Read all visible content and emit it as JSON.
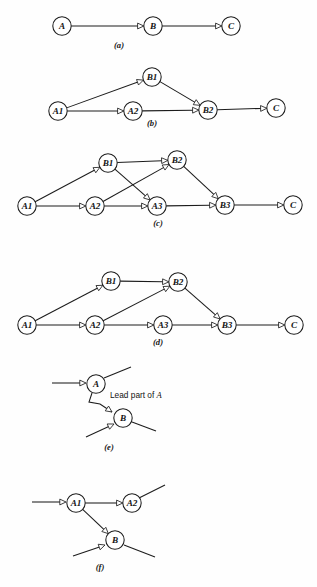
{
  "figure": {
    "width": 317,
    "height": 587,
    "background_color": "#fefefe",
    "ink_color": "#1c1c1c",
    "node_radius": 9.2,
    "arrow_style": "open-triangle-hollow"
  },
  "panels": [
    {
      "id": "a",
      "caption": "(a)",
      "caption_x": 119,
      "caption_y": 48,
      "nodes": [
        {
          "id": "A",
          "label": "A",
          "x": 62,
          "y": 26
        },
        {
          "id": "B",
          "label": "B",
          "x": 153,
          "y": 26
        },
        {
          "id": "C",
          "label": "C",
          "x": 231,
          "y": 26
        }
      ],
      "edges": [
        {
          "from": "A",
          "to": "B",
          "arrow": true
        },
        {
          "from": "B",
          "to": "C",
          "arrow": true
        }
      ],
      "stubs": []
    },
    {
      "id": "b",
      "caption": "(b)",
      "caption_x": 152,
      "caption_y": 126,
      "nodes": [
        {
          "id": "A1",
          "label": "A1",
          "x": 58,
          "y": 111
        },
        {
          "id": "A2",
          "label": "A2",
          "x": 133,
          "y": 111
        },
        {
          "id": "B1",
          "label": "B1",
          "x": 152,
          "y": 77
        },
        {
          "id": "B2",
          "label": "B2",
          "x": 208,
          "y": 110
        },
        {
          "id": "C",
          "label": "C",
          "x": 276,
          "y": 108
        }
      ],
      "edges": [
        {
          "from": "A1",
          "to": "B1",
          "arrow": true
        },
        {
          "from": "A1",
          "to": "A2",
          "arrow": true
        },
        {
          "from": "A2",
          "to": "B2",
          "arrow": true
        },
        {
          "from": "B1",
          "to": "B2",
          "arrow": true
        },
        {
          "from": "B2",
          "to": "C",
          "arrow": true
        }
      ],
      "stubs": []
    },
    {
      "id": "c",
      "caption": "(c)",
      "caption_x": 158,
      "caption_y": 226,
      "nodes": [
        {
          "id": "A1",
          "label": "A1",
          "x": 27,
          "y": 206
        },
        {
          "id": "A2",
          "label": "A2",
          "x": 95,
          "y": 206
        },
        {
          "id": "A3",
          "label": "A3",
          "x": 157,
          "y": 206
        },
        {
          "id": "B1",
          "label": "B1",
          "x": 108,
          "y": 163
        },
        {
          "id": "B2",
          "label": "B2",
          "x": 177,
          "y": 160
        },
        {
          "id": "B3",
          "label": "B3",
          "x": 225,
          "y": 205
        },
        {
          "id": "C",
          "label": "C",
          "x": 293,
          "y": 205
        }
      ],
      "edges": [
        {
          "from": "A1",
          "to": "B1",
          "arrow": true
        },
        {
          "from": "A1",
          "to": "A2",
          "arrow": true
        },
        {
          "from": "A2",
          "to": "A3",
          "arrow": true
        },
        {
          "from": "A2",
          "to": "B2",
          "arrow": true
        },
        {
          "from": "B1",
          "to": "B2",
          "arrow": true
        },
        {
          "from": "B1",
          "to": "A3",
          "arrow": true
        },
        {
          "from": "B2",
          "to": "B3",
          "arrow": true
        },
        {
          "from": "A3",
          "to": "B3",
          "arrow": true
        },
        {
          "from": "B3",
          "to": "C",
          "arrow": true
        }
      ],
      "stubs": []
    },
    {
      "id": "d",
      "caption": "(d)",
      "caption_x": 158,
      "caption_y": 345,
      "nodes": [
        {
          "id": "A1",
          "label": "A1",
          "x": 27,
          "y": 325
        },
        {
          "id": "A2",
          "label": "A2",
          "x": 95,
          "y": 325
        },
        {
          "id": "A3",
          "label": "A3",
          "x": 163,
          "y": 325
        },
        {
          "id": "B1",
          "label": "B1",
          "x": 111,
          "y": 281
        },
        {
          "id": "B2",
          "label": "B2",
          "x": 178,
          "y": 282
        },
        {
          "id": "B3",
          "label": "B3",
          "x": 227,
          "y": 325
        },
        {
          "id": "C",
          "label": "C",
          "x": 294,
          "y": 325
        }
      ],
      "edges": [
        {
          "from": "A1",
          "to": "B1",
          "arrow": true
        },
        {
          "from": "A1",
          "to": "A2",
          "arrow": true
        },
        {
          "from": "A2",
          "to": "A3",
          "arrow": true
        },
        {
          "from": "A2",
          "to": "B2",
          "arrow": true
        },
        {
          "from": "B1",
          "to": "B2",
          "arrow": true
        },
        {
          "from": "B2",
          "to": "B3",
          "arrow": true
        },
        {
          "from": "A3",
          "to": "B3",
          "arrow": true
        },
        {
          "from": "B3",
          "to": "C",
          "arrow": true
        }
      ],
      "stubs": []
    },
    {
      "id": "e",
      "caption": "(e)",
      "caption_x": 109,
      "caption_y": 450,
      "annotation": {
        "text_before": "Lead part of ",
        "text_italic": "A",
        "x": 110,
        "y": 398
      },
      "nodes": [
        {
          "id": "A",
          "label": "A",
          "x": 96,
          "y": 384
        },
        {
          "id": "B",
          "label": "B",
          "x": 123,
          "y": 418
        }
      ],
      "edges": [
        {
          "from": "A",
          "to": "B",
          "arrow": true,
          "bend": true,
          "path": "M 92 393 L 89 402 L 100 404 L 112 412",
          "arrow_at": [
            112,
            412
          ],
          "arrow_angle": 35
        }
      ],
      "stubs": [
        {
          "name": "incoming-left-a",
          "x1": 52,
          "y1": 383,
          "x2": 86,
          "y2": 383,
          "arrow": true
        },
        {
          "name": "outgoing-upright-a",
          "x1": 104,
          "y1": 378,
          "x2": 131,
          "y2": 367,
          "arrow": false
        },
        {
          "name": "incoming-lowleft-b",
          "x1": 86,
          "y1": 437,
          "x2": 114,
          "y2": 424,
          "arrow": true
        },
        {
          "name": "outgoing-right-b",
          "x1": 132,
          "y1": 422,
          "x2": 156,
          "y2": 431,
          "arrow": false
        }
      ]
    },
    {
      "id": "f",
      "caption": "(f)",
      "caption_x": 100,
      "caption_y": 570,
      "nodes": [
        {
          "id": "A1",
          "label": "A1",
          "x": 76,
          "y": 503
        },
        {
          "id": "A2",
          "label": "A2",
          "x": 132,
          "y": 503
        },
        {
          "id": "B",
          "label": "B",
          "x": 115,
          "y": 540
        }
      ],
      "edges": [
        {
          "from": "A1",
          "to": "A2",
          "arrow": true
        },
        {
          "from": "A1",
          "to": "B",
          "arrow": true
        }
      ],
      "stubs": [
        {
          "name": "incoming-left-a1",
          "x1": 32,
          "y1": 502,
          "x2": 66,
          "y2": 502,
          "arrow": true
        },
        {
          "name": "outgoing-upright-a2",
          "x1": 139,
          "y1": 498,
          "x2": 165,
          "y2": 485,
          "arrow": false
        },
        {
          "name": "incoming-lowleft-b",
          "x1": 73,
          "y1": 556,
          "x2": 105,
          "y2": 545,
          "arrow": true
        },
        {
          "name": "outgoing-right-b",
          "x1": 124,
          "y1": 545,
          "x2": 155,
          "y2": 557,
          "arrow": false
        }
      ]
    }
  ]
}
